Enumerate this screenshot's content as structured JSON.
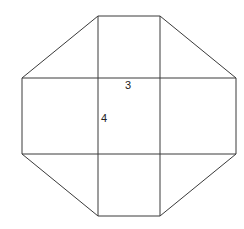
{
  "diagram": {
    "type": "net-of-octagonal-figure",
    "labels": [
      {
        "text": "3",
        "x": 125,
        "y": 89,
        "meaning": "length of central rectangle top edge"
      },
      {
        "text": "4",
        "x": 101,
        "y": 122,
        "meaning": "length of central rectangle left edge"
      }
    ],
    "outer_octagon": [
      [
        98,
        16
      ],
      [
        160,
        16
      ],
      [
        236,
        78
      ],
      [
        236,
        154
      ],
      [
        160,
        216
      ],
      [
        98,
        216
      ],
      [
        22,
        154
      ],
      [
        22,
        78
      ]
    ],
    "central_rectangle": {
      "x1": 98,
      "y1": 78,
      "x2": 160,
      "y2": 154
    },
    "stroke_color": "#3a3a3a",
    "background_color": "#ffffff"
  }
}
